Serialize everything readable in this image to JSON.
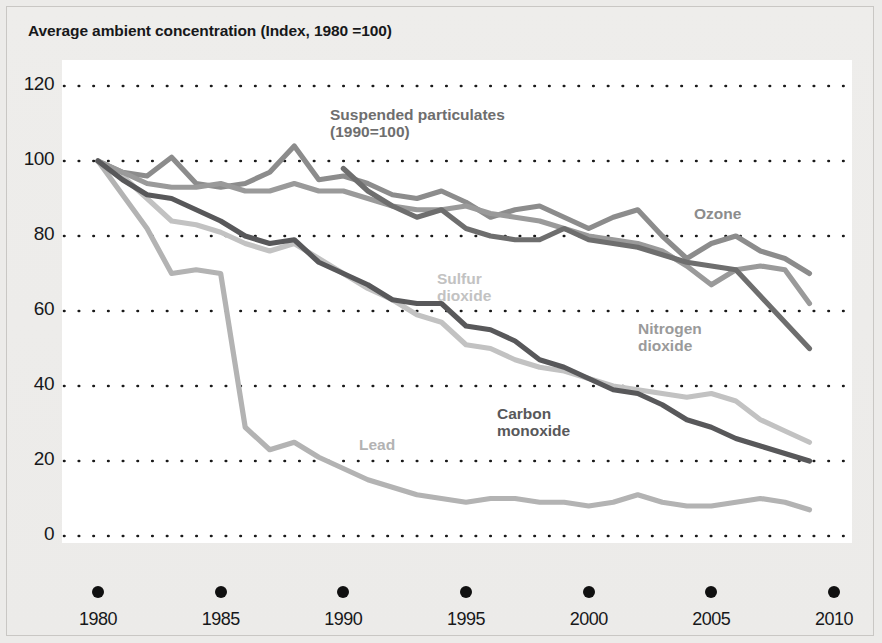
{
  "chart_title": "Average ambient concentration (Index, 1980 =100)",
  "axis": {
    "y_ticks": [
      "0",
      "20",
      "40",
      "60",
      "80",
      "100",
      "120"
    ],
    "x_ticks": [
      "1980",
      "1985",
      "1990",
      "1995",
      "2000",
      "2005",
      "2010"
    ],
    "x_axis_title": "Year"
  },
  "series_labels": [
    {
      "key": "suspended",
      "text": "Suspended particulates\n(1990=100)",
      "color": "#6e6e6e",
      "left": 330,
      "top": 106
    },
    {
      "key": "ozone",
      "text": "Ozone",
      "color": "#8c8c8c",
      "left": 694,
      "top": 205
    },
    {
      "key": "sulfur",
      "text": "Sulfur\ndioxide",
      "color": "#c2c2c2",
      "left": 437,
      "top": 270
    },
    {
      "key": "nitrogen",
      "text": "Nitrogen\ndioxide",
      "color": "#9a9a9a",
      "left": 638,
      "top": 320
    },
    {
      "key": "carbon",
      "text": "Carbon\nmonoxide",
      "color": "#58585a",
      "left": 497,
      "top": 405
    },
    {
      "key": "lead",
      "text": "Lead",
      "color": "#b3b3b3",
      "left": 359,
      "top": 436
    }
  ],
  "chart_data": {
    "type": "line",
    "title": "Average ambient concentration (Index, 1980 =100)",
    "xlabel": "Year",
    "ylabel": "",
    "xlim": [
      1980,
      2010
    ],
    "ylim": [
      0,
      120
    ],
    "grid": "horizontal dotted",
    "legend": "inline labels next to lines",
    "x": [
      1980,
      1981,
      1982,
      1983,
      1984,
      1985,
      1986,
      1987,
      1988,
      1989,
      1990,
      1991,
      1992,
      1993,
      1994,
      1995,
      1996,
      1997,
      1998,
      1999,
      2000,
      2001,
      2002,
      2003,
      2004,
      2005,
      2006,
      2007,
      2008,
      2009
    ],
    "series": [
      {
        "name": "Ozone",
        "color": "#8c8c8c",
        "values": [
          100,
          97,
          96,
          101,
          94,
          93,
          94,
          97,
          104,
          95,
          96,
          94,
          91,
          90,
          92,
          89,
          85,
          87,
          88,
          85,
          82,
          85,
          87,
          80,
          74,
          78,
          80,
          76,
          74,
          70
        ]
      },
      {
        "name": "Nitrogen dioxide",
        "color": "#9a9a9a",
        "values": [
          100,
          97,
          94,
          93,
          93,
          94,
          92,
          92,
          94,
          92,
          92,
          90,
          88,
          87,
          87,
          88,
          86,
          85,
          84,
          82,
          80,
          79,
          78,
          76,
          72,
          67,
          71,
          72,
          71,
          62
        ]
      },
      {
        "name": "Suspended particulates (1990=100)",
        "color": "#6e6e6e",
        "values": [
          null,
          null,
          null,
          null,
          null,
          null,
          null,
          null,
          null,
          null,
          98,
          92,
          88,
          85,
          87,
          82,
          80,
          79,
          79,
          82,
          79,
          78,
          77,
          75,
          73,
          72,
          71,
          64,
          57,
          50
        ]
      },
      {
        "name": "Sulfur dioxide",
        "color": "#c2c2c2",
        "values": [
          100,
          96,
          90,
          84,
          83,
          81,
          78,
          76,
          78,
          74,
          70,
          66,
          63,
          59,
          57,
          51,
          50,
          47,
          45,
          44,
          42,
          40,
          39,
          38,
          37,
          38,
          36,
          31,
          28,
          25
        ]
      },
      {
        "name": "Carbon monoxide",
        "color": "#58585a",
        "values": [
          100,
          95,
          91,
          90,
          87,
          84,
          80,
          78,
          79,
          73,
          70,
          67,
          63,
          62,
          62,
          56,
          55,
          52,
          47,
          45,
          42,
          39,
          38,
          35,
          31,
          29,
          26,
          24,
          22,
          20
        ]
      },
      {
        "name": "Lead",
        "color": "#b3b3b3",
        "values": [
          100,
          91,
          82,
          70,
          71,
          70,
          29,
          23,
          25,
          21,
          18,
          15,
          13,
          11,
          10,
          9,
          10,
          10,
          9,
          9,
          8,
          9,
          11,
          9,
          8,
          8,
          9,
          10,
          9,
          7
        ]
      }
    ]
  }
}
